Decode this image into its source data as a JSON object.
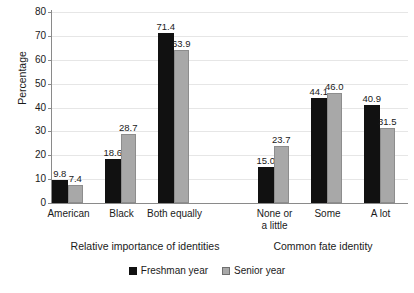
{
  "chart_data": {
    "type": "bar",
    "title": "",
    "xlabel": "",
    "ylabel": "Percentage",
    "ylim": [
      0,
      80
    ],
    "ytick_step": 10,
    "yticks": [
      0,
      10,
      20,
      30,
      40,
      50,
      60,
      70,
      80
    ],
    "grid": "horizontal",
    "legend_position": "bottom-center",
    "series": [
      {
        "name": "Freshman year",
        "color": "#111111",
        "values": [
          9.8,
          18.6,
          71.4,
          15.0,
          44.1,
          40.9
        ]
      },
      {
        "name": "Senior year",
        "color": "#a8a8a8",
        "values": [
          7.4,
          28.7,
          63.9,
          23.7,
          46.0,
          31.5
        ]
      }
    ],
    "categories": [
      "American",
      "Black",
      "Both equally",
      "None or\na little",
      "Some",
      "A lot"
    ],
    "groups": [
      {
        "title": "Relative importance of identities",
        "categories": [
          "American",
          "Black",
          "Both equally"
        ],
        "freshman": [
          9.8,
          18.6,
          71.4
        ],
        "senior": [
          7.4,
          28.7,
          63.9
        ]
      },
      {
        "title": "Common fate identity",
        "categories": [
          "None or\na little",
          "Some",
          "A lot"
        ],
        "freshman": [
          15.0,
          44.1,
          40.9
        ],
        "senior": [
          23.7,
          46.0,
          31.5
        ]
      }
    ],
    "data_labels": {
      "freshman": [
        "9.8",
        "18.6",
        "71.4",
        "15.0",
        "44.1",
        "40.9"
      ],
      "senior": [
        "7.4",
        "28.7",
        "63.9",
        "23.7",
        "46.0",
        "31.5"
      ]
    }
  },
  "axis": {
    "y_title": "Percentage",
    "y_ticks": [
      "0",
      "10",
      "20",
      "30",
      "40",
      "50",
      "60",
      "70",
      "80"
    ]
  },
  "categories": [
    {
      "label": "American"
    },
    {
      "label": "Black"
    },
    {
      "label": "Both equally"
    },
    {
      "label": "None or\na little"
    },
    {
      "label": "Some"
    },
    {
      "label": "A lot"
    }
  ],
  "group_titles": [
    {
      "label": "Relative importance of identities"
    },
    {
      "label": "Common fate identity"
    }
  ],
  "legend": {
    "items": [
      {
        "label": "Freshman year",
        "color": "#111111"
      },
      {
        "label": "Senior year",
        "color": "#a8a8a8"
      }
    ]
  }
}
